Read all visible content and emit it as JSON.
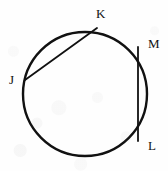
{
  "figure": {
    "background_color": "#fefefe",
    "stroke_color": "#111111",
    "label_color": "#111111",
    "circle": {
      "name": "circle-outline",
      "center_x": 85,
      "center_y": 94,
      "radius": 62,
      "stroke_width": 2.4
    },
    "chords": [
      {
        "name": "chord-jk",
        "from": "J",
        "to": "K",
        "x1": 25,
        "y1": 80,
        "x2": 97,
        "y2": 28,
        "stroke_width": 1.8
      },
      {
        "name": "chord-ml",
        "from": "M",
        "to": "L",
        "x1": 138,
        "y1": 47,
        "x2": 138,
        "y2": 141,
        "stroke_width": 1.8
      }
    ],
    "points": [
      {
        "id": "K",
        "label": "K",
        "point_x": 97,
        "point_y": 28,
        "label_x": 96,
        "label_y": 7
      },
      {
        "id": "M",
        "label": "M",
        "point_x": 138,
        "point_y": 47,
        "label_x": 148,
        "label_y": 37
      },
      {
        "id": "J",
        "label": "J",
        "point_x": 25,
        "point_y": 80,
        "label_x": 9,
        "label_y": 73
      },
      {
        "id": "L",
        "label": "L",
        "point_x": 138,
        "point_y": 141,
        "label_x": 148,
        "label_y": 139
      }
    ]
  }
}
